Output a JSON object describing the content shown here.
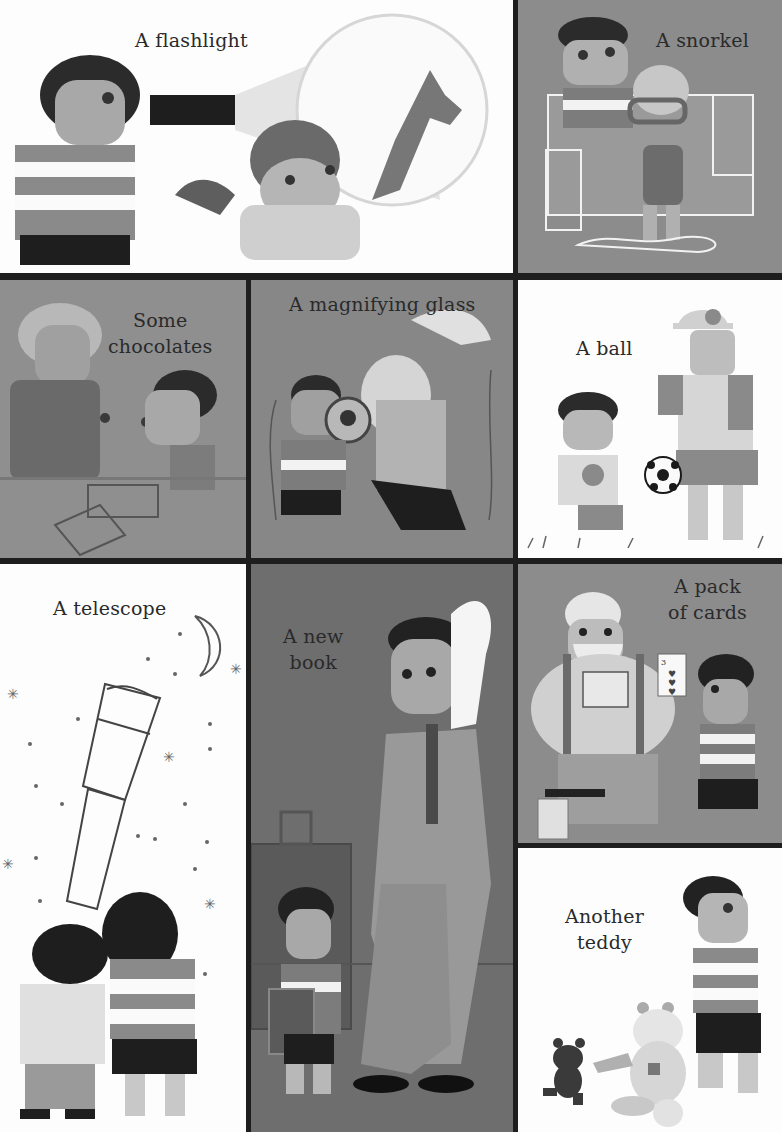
{
  "page": {
    "layout": "3-row illustrated grid, 9 panels",
    "colors": {
      "border": "#1a1a1a",
      "white_panel": "#fdfdfd",
      "gray_panel": "#8c8c8c",
      "dark_gray_panel": "#6e6e6e",
      "caption_text": "#2a2a2a"
    }
  },
  "panels": [
    {
      "id": "flashlight",
      "caption_lines": [
        "A flashlight"
      ],
      "background": "white"
    },
    {
      "id": "snorkel",
      "caption_lines": [
        "A snorkel"
      ],
      "background": "gray"
    },
    {
      "id": "chocolates",
      "caption_lines": [
        "Some",
        "chocolates"
      ],
      "background": "gray"
    },
    {
      "id": "magnifying-glass",
      "caption_lines": [
        "A magnifying glass"
      ],
      "background": "gray"
    },
    {
      "id": "ball",
      "caption_lines": [
        "A ball"
      ],
      "background": "white"
    },
    {
      "id": "telescope",
      "caption_lines": [
        "A telescope"
      ],
      "background": "white"
    },
    {
      "id": "new-book",
      "caption_lines": [
        "A new",
        "book"
      ],
      "background": "dark-gray"
    },
    {
      "id": "pack-of-cards",
      "caption_lines": [
        "A pack",
        "of cards"
      ],
      "background": "gray"
    },
    {
      "id": "teddy",
      "caption_lines": [
        "Another",
        "teddy"
      ],
      "background": "white"
    }
  ],
  "details": {
    "playing_card": {
      "rank": "3",
      "suit": "hearts"
    }
  }
}
